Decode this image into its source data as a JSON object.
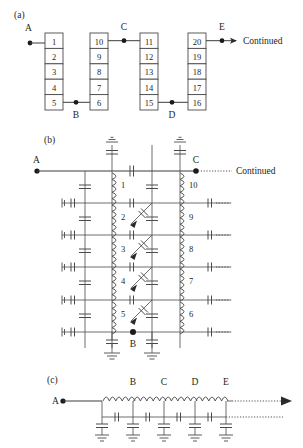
{
  "figure": {
    "background_color": "#ffffff",
    "line_color": "#4a4a4a",
    "text_color": "#231f20"
  },
  "panel_a": {
    "label": "(a)",
    "terminals": [
      {
        "name": "A",
        "x": 30,
        "y": 43
      },
      {
        "name": "B",
        "x": 76,
        "y": 113
      },
      {
        "name": "C",
        "x": 124,
        "y": 28
      },
      {
        "name": "D",
        "x": 172,
        "y": 113
      },
      {
        "name": "E",
        "x": 220,
        "y": 28
      }
    ],
    "continued_label": "Continued",
    "columns": [
      {
        "id": "col-1",
        "cells": [
          "1",
          "2",
          "3",
          "4",
          "5"
        ]
      },
      {
        "id": "col-2",
        "cells": [
          "10",
          "9",
          "8",
          "7",
          "6"
        ]
      },
      {
        "id": "col-3",
        "cells": [
          "11",
          "12",
          "13",
          "14",
          "15"
        ]
      },
      {
        "id": "col-4",
        "cells": [
          "20",
          "19",
          "18",
          "17",
          "16"
        ]
      }
    ]
  },
  "panel_b": {
    "label": "(b)",
    "continued_label": "Continued",
    "terminals": [
      {
        "name": "A",
        "x": 37,
        "y": 168
      },
      {
        "name": "C",
        "x": 197,
        "y": 160
      },
      {
        "name": "B",
        "x": 133,
        "y": 345
      }
    ],
    "left_coil_numbers": [
      "1",
      "2",
      "3",
      "4",
      "5"
    ],
    "right_coil_numbers": [
      "10",
      "9",
      "8",
      "7",
      "6"
    ],
    "rung_count": 6,
    "symbols": {
      "inductor": "coil-winding",
      "capacitor": "parallel-plate",
      "ground": "earth-ground",
      "coupling": "diagonal-capacitor-arrow"
    }
  },
  "panel_c": {
    "label": "(c)",
    "node_labels": [
      "A",
      "B",
      "C",
      "D",
      "E"
    ],
    "series_inductors": 4,
    "shunt_capacitors": 5,
    "series_capacitors": 4,
    "ground_count": 5,
    "continues": true
  }
}
